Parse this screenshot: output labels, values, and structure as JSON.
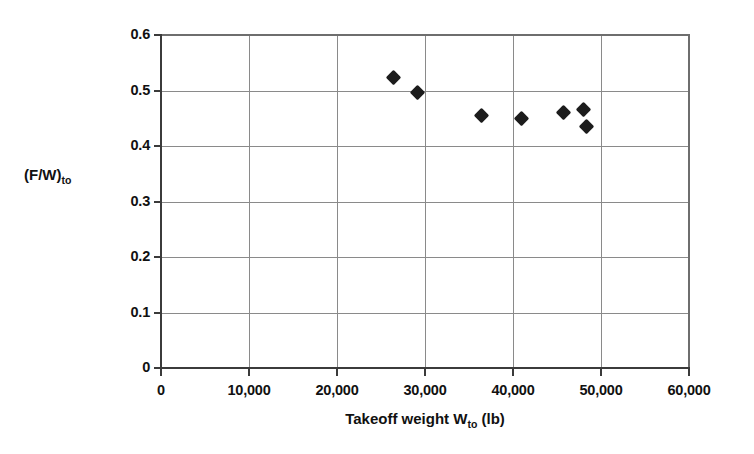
{
  "chart_data": {
    "type": "scatter",
    "title": "",
    "xlabel": "Takeoff weight W_to (lb)",
    "xlabel_main": "Takeoff weight W",
    "xlabel_sub": "to",
    "xlabel_unit": " (lb)",
    "ylabel": "(F/W)_to",
    "ylabel_main": "(F/W)",
    "ylabel_sub": "to",
    "xlim": [
      0,
      60000
    ],
    "ylim": [
      0,
      0.6
    ],
    "grid": true,
    "legend": "none",
    "marker": "filled-diamond",
    "marker_color": "#1c1c1c",
    "xticks": [
      0,
      10000,
      20000,
      30000,
      40000,
      50000,
      60000
    ],
    "xtick_labels": [
      "0",
      "10,000",
      "20,000",
      "30,000",
      "40,000",
      "50,000",
      "60,000"
    ],
    "yticks": [
      0,
      0.1,
      0.2,
      0.3,
      0.4,
      0.5,
      0.6
    ],
    "ytick_labels": [
      "0",
      "0.1",
      "0.2",
      "0.3",
      "0.4",
      "0.5",
      "0.6"
    ],
    "points": [
      {
        "x": 26400,
        "y": 0.523
      },
      {
        "x": 29100,
        "y": 0.497
      },
      {
        "x": 36400,
        "y": 0.455
      },
      {
        "x": 41000,
        "y": 0.449
      },
      {
        "x": 45700,
        "y": 0.461
      },
      {
        "x": 48000,
        "y": 0.466
      },
      {
        "x": 48400,
        "y": 0.436
      }
    ]
  }
}
